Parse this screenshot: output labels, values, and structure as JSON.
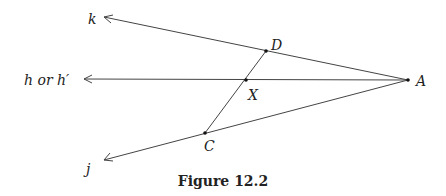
{
  "figure": {
    "caption": "Figure 12.2",
    "rays": [
      {
        "name": "k",
        "label": "k"
      },
      {
        "name": "h",
        "label": "h or h′"
      },
      {
        "name": "j",
        "label": "j"
      }
    ],
    "points": {
      "A": "A",
      "D": "D",
      "X": "X",
      "C": "C"
    },
    "colors": {
      "line": "#444444",
      "text": "#222222"
    }
  }
}
